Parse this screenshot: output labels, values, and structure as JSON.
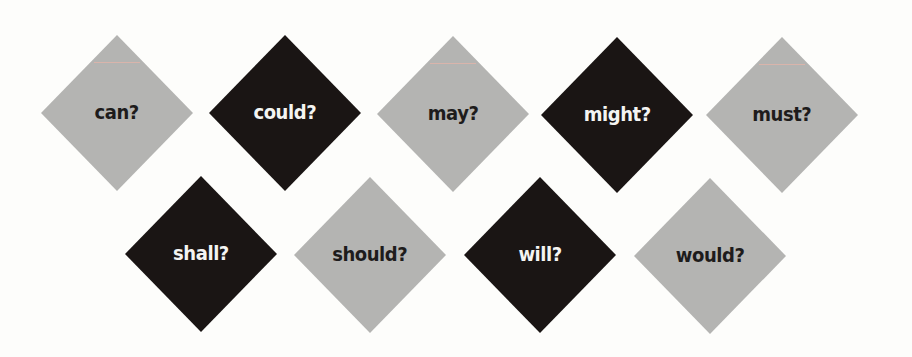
{
  "colors": {
    "background": "#fdfdfb",
    "gray_diamond": "#b4b4b2",
    "black_diamond": "#1a1514",
    "text_on_gray": "#1e1c1c",
    "text_on_black": "#f4f4f2"
  },
  "rows": [
    {
      "items": [
        {
          "word": "can?",
          "style": "gray"
        },
        {
          "word": "could?",
          "style": "black"
        },
        {
          "word": "may?",
          "style": "gray"
        },
        {
          "word": "might?",
          "style": "black"
        },
        {
          "word": "must?",
          "style": "gray"
        }
      ]
    },
    {
      "items": [
        {
          "word": "shall?",
          "style": "black"
        },
        {
          "word": "should?",
          "style": "gray"
        },
        {
          "word": "will?",
          "style": "black"
        },
        {
          "word": "would?",
          "style": "gray"
        }
      ]
    }
  ]
}
